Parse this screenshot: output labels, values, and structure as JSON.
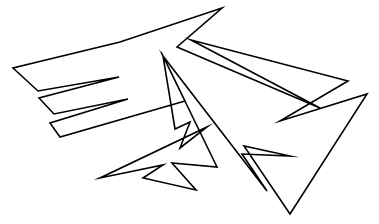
{
  "figure": {
    "canvas": {
      "width": 379,
      "height": 224,
      "background_color": "#ffffff"
    },
    "style": {
      "stroke_color": "#000000",
      "stroke_width": 1.6,
      "fill_color": "#ffffff",
      "line_join": "miter"
    },
    "shapes": [
      {
        "name": "main-outline",
        "closed": true,
        "vertex_count": 34,
        "points": [
          [
            222,
            8
          ],
          [
            120,
            42
          ],
          [
            13,
            68
          ],
          [
            38,
            91
          ],
          [
            119,
            77
          ],
          [
            39,
            98
          ],
          [
            54,
            114
          ],
          [
            128,
            99
          ],
          [
            50,
            123
          ],
          [
            60,
            137
          ],
          [
            185,
            101
          ],
          [
            163,
            56
          ],
          [
            175,
            129
          ],
          [
            190,
            122
          ],
          [
            180,
            148
          ],
          [
            207,
            127
          ],
          [
            100,
            178
          ],
          [
            163,
            165
          ],
          [
            143,
            178
          ],
          [
            196,
            190
          ],
          [
            172,
            163
          ],
          [
            217,
            167
          ],
          [
            163,
            56
          ],
          [
            267,
            191
          ],
          [
            242,
            154
          ],
          [
            290,
            156
          ],
          [
            244,
            146
          ],
          [
            290,
            214
          ],
          [
            367,
            94
          ],
          [
            280,
            121
          ],
          [
            348,
            81
          ],
          [
            191,
            40
          ],
          [
            320,
            108
          ],
          [
            177,
            47
          ]
        ]
      }
    ]
  }
}
